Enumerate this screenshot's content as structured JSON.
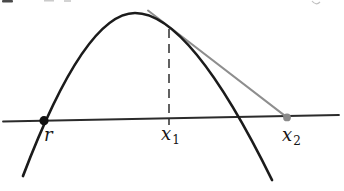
{
  "figure": {
    "kind": "function-graph-sketch",
    "labels": {
      "root": "r",
      "x1_base": "x",
      "x1_sub": "1",
      "x2_base": "x",
      "x2_sub": "2"
    },
    "colors": {
      "curve": "#1b1b1b",
      "axis": "#2b2b2b",
      "tangent": "#8e8e8e",
      "root_dot": "#111111",
      "x2_dot": "#8a8a8a",
      "dashed": "#2e2e2e",
      "label_text": "#151515"
    }
  }
}
